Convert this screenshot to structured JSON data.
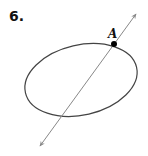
{
  "problem": {
    "number": "6."
  },
  "figure": {
    "point_label": "A",
    "ellipse": {
      "cx": 81,
      "cy": 80,
      "rx": 57,
      "ry": 35,
      "rotate": -13,
      "stroke": "#444444"
    },
    "line": {
      "x1": 136,
      "y1": 14,
      "x2": 40,
      "y2": 146,
      "stroke": "#888888"
    },
    "point": {
      "x": 114,
      "y": 44,
      "color": "#000000"
    }
  }
}
